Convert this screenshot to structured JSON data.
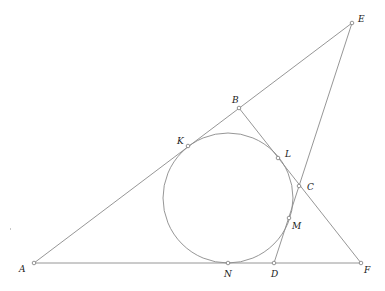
{
  "figure": {
    "width": 385,
    "height": 291,
    "colors": {
      "background": "#ffffff",
      "line": "#8a8a8a",
      "point_stroke": "#7a7a7a",
      "label": "#1a1a1a"
    },
    "points": {
      "A": {
        "x": 34,
        "y": 263,
        "label": "A",
        "lx": 19,
        "ly": 272
      },
      "B": {
        "x": 239,
        "y": 108,
        "label": "B",
        "lx": 232,
        "ly": 103
      },
      "C": {
        "x": 299,
        "y": 186,
        "label": "C",
        "lx": 307,
        "ly": 190
      },
      "D": {
        "x": 274,
        "y": 263,
        "label": "D",
        "lx": 271,
        "ly": 277
      },
      "E": {
        "x": 352,
        "y": 23,
        "label": "E",
        "lx": 358,
        "ly": 22
      },
      "F": {
        "x": 361,
        "y": 263,
        "label": "F",
        "lx": 364,
        "ly": 273
      },
      "K": {
        "x": 188,
        "y": 146,
        "label": "K",
        "lx": 177,
        "ly": 144
      },
      "L": {
        "x": 278,
        "y": 158,
        "label": "L",
        "lx": 285,
        "ly": 157
      },
      "M": {
        "x": 289,
        "y": 218,
        "label": "M",
        "lx": 292,
        "ly": 229
      },
      "N": {
        "x": 228,
        "y": 263,
        "label": "N",
        "lx": 224,
        "ly": 277
      }
    },
    "segments": [
      {
        "from": "A",
        "to": "E",
        "name": "line-AE"
      },
      {
        "from": "A",
        "to": "F",
        "name": "line-AF"
      },
      {
        "from": "B",
        "to": "F",
        "name": "line-BF"
      },
      {
        "from": "E",
        "to": "D",
        "name": "line-ED"
      }
    ],
    "circle": {
      "name": "incircle",
      "cx": 228,
      "cy": 198,
      "r": 65
    },
    "tangent_points": [
      "K",
      "L",
      "M",
      "N"
    ]
  }
}
